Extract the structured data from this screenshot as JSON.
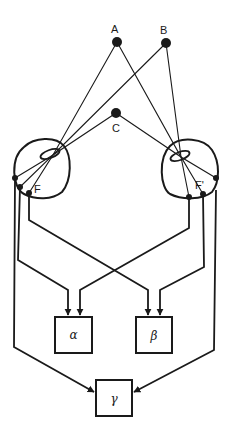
{
  "diagram": {
    "type": "binocular-vision-schematic",
    "points": [
      {
        "id": "A",
        "label": "A",
        "x": 117,
        "y": 42
      },
      {
        "id": "B",
        "label": "B",
        "x": 166,
        "y": 43
      },
      {
        "id": "C",
        "label": "C",
        "x": 116,
        "y": 113
      }
    ],
    "eyes": [
      {
        "id": "left-eye",
        "cx": 41,
        "cy": 169,
        "r": 29,
        "lens": {
          "cx": 50,
          "cy": 154
        },
        "fovea_label": "F",
        "retina_points": [
          [
            15,
            178
          ],
          [
            20,
            187
          ],
          [
            29,
            193
          ]
        ]
      },
      {
        "id": "right-eye",
        "cx": 190,
        "cy": 168,
        "r": 28,
        "lens": {
          "cx": 180,
          "cy": 156
        },
        "fovea_label": "F'",
        "retina_points": [
          [
            189,
            197
          ],
          [
            203,
            194
          ],
          [
            216,
            178
          ]
        ]
      }
    ],
    "boxes": [
      {
        "id": "alpha",
        "label": "α",
        "x": 55,
        "y": 317,
        "w": 37,
        "h": 36
      },
      {
        "id": "beta",
        "label": "β",
        "x": 136,
        "y": 317,
        "w": 36,
        "h": 36
      },
      {
        "id": "gamma",
        "label": "γ",
        "x": 96,
        "y": 380,
        "w": 36,
        "h": 36
      }
    ],
    "colors": {
      "stroke": "#1a1a1a",
      "background": "#ffffff"
    }
  }
}
